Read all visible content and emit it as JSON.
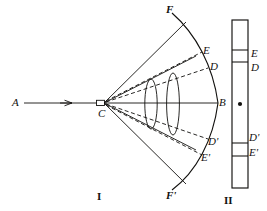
{
  "figure": {
    "title": "",
    "background_color": "#ffffff",
    "ink_color": "#12110f",
    "panels": [
      {
        "id": "I",
        "caption": "I",
        "caption_x": 97,
        "caption_y": 191
      },
      {
        "id": "II",
        "caption": "II",
        "caption_x": 224,
        "caption_y": 195
      }
    ],
    "panel_I": {
      "source_label": "A",
      "source_x": 12,
      "source_y": 97,
      "slit_label": "C",
      "slit_x": 98,
      "slit_y": 108,
      "axis_label": "B",
      "axis_x": 219,
      "axis_y": 97,
      "arc_top_label": "F",
      "arc_top_x": 166,
      "arc_top_y": 4,
      "arc_bottom_label": "F'",
      "arc_bottom_x": 166,
      "arc_bottom_y": 190,
      "arc_labels": [
        {
          "text": "E",
          "x": 203,
          "y": 45
        },
        {
          "text": "D",
          "x": 210,
          "y": 61
        },
        {
          "text": "D'",
          "x": 208,
          "y": 136
        },
        {
          "text": "E'",
          "x": 201,
          "y": 152
        }
      ],
      "lens_count": 2,
      "ray_count_solid": 3,
      "ray_count_dashed": 2
    },
    "panel_II": {
      "screen_x": 232,
      "screen_y": 20,
      "screen_w": 16,
      "screen_h": 168,
      "center_dot_x": 240,
      "center_dot_y": 104,
      "division_lines_y": [
        50,
        62,
        143,
        156
      ],
      "band_labels": [
        {
          "text": "E",
          "x": 251,
          "y": 48
        },
        {
          "text": "D",
          "x": 251,
          "y": 62
        },
        {
          "text": "D'",
          "x": 249,
          "y": 132
        },
        {
          "text": "E'",
          "x": 249,
          "y": 147
        }
      ]
    }
  }
}
